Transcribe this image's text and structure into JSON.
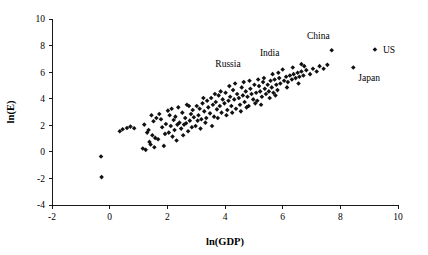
{
  "chart_data": {
    "type": "scatter",
    "title": "",
    "xlabel": "ln(GDP)",
    "ylabel": "ln(E)",
    "xlim": [
      -2,
      10
    ],
    "ylim": [
      -4,
      10
    ],
    "xticks": [
      -2,
      0,
      2,
      4,
      6,
      8,
      10
    ],
    "xticklabels": [
      "-2",
      "0",
      "2",
      "4",
      "6",
      "8",
      "10"
    ],
    "yticks": [
      -4,
      -2,
      0,
      2,
      4,
      6,
      8,
      10
    ],
    "yticklabels": [
      "-4",
      "-2",
      "0",
      "2",
      "4",
      "6",
      "8",
      "10"
    ],
    "grid": false,
    "legend": false,
    "marker": "diamond",
    "marker_color": "#111111",
    "annotations": [
      {
        "label": "Russia",
        "x": 6.0,
        "y": 6.2,
        "label_dx": -42,
        "label_dy": -2
      },
      {
        "label": "India",
        "x": 6.65,
        "y": 6.6,
        "label_dx": -22,
        "label_dy": -8
      },
      {
        "label": "China",
        "x": 7.7,
        "y": 7.65,
        "label_dx": -2,
        "label_dy": -11
      },
      {
        "label": "US",
        "x": 9.2,
        "y": 7.7,
        "label_dx": 8,
        "label_dy": 3
      },
      {
        "label": "Japan",
        "x": 8.45,
        "y": 6.35,
        "label_dx": 5,
        "label_dy": 14
      }
    ],
    "points": [
      [
        -0.3,
        -0.35
      ],
      [
        -0.28,
        -1.9
      ],
      [
        0.35,
        1.55
      ],
      [
        0.45,
        1.7
      ],
      [
        0.6,
        1.8
      ],
      [
        0.72,
        1.9
      ],
      [
        0.85,
        1.78
      ],
      [
        1.2,
        2.05
      ],
      [
        1.3,
        1.45
      ],
      [
        1.38,
        0.75
      ],
      [
        1.42,
        0.55
      ],
      [
        1.48,
        1.25
      ],
      [
        1.52,
        2.3
      ],
      [
        1.55,
        0.35
      ],
      [
        1.58,
        1.05
      ],
      [
        1.62,
        2.55
      ],
      [
        1.68,
        0.95
      ],
      [
        1.72,
        2.85
      ],
      [
        1.78,
        2.45
      ],
      [
        1.82,
        1.85
      ],
      [
        1.88,
        0.45
      ],
      [
        1.92,
        1.35
      ],
      [
        1.95,
        2.1
      ],
      [
        2.02,
        3.1
      ],
      [
        2.08,
        2.75
      ],
      [
        2.12,
        1.95
      ],
      [
        2.18,
        1.15
      ],
      [
        2.22,
        2.4
      ],
      [
        2.28,
        2.65
      ],
      [
        2.32,
        0.85
      ],
      [
        2.38,
        3.35
      ],
      [
        2.42,
        2.2
      ],
      [
        2.48,
        1.75
      ],
      [
        2.52,
        2.95
      ],
      [
        2.58,
        2.05
      ],
      [
        2.62,
        2.55
      ],
      [
        2.68,
        3.55
      ],
      [
        2.72,
        1.55
      ],
      [
        2.78,
        2.35
      ],
      [
        2.82,
        2.85
      ],
      [
        2.88,
        3.15
      ],
      [
        2.92,
        2.6
      ],
      [
        2.98,
        1.95
      ],
      [
        3.02,
        3.45
      ],
      [
        3.08,
        2.75
      ],
      [
        3.12,
        3.25
      ],
      [
        3.18,
        2.45
      ],
      [
        3.22,
        3.65
      ],
      [
        3.28,
        3.05
      ],
      [
        3.32,
        2.2
      ],
      [
        3.38,
        3.85
      ],
      [
        3.42,
        3.35
      ],
      [
        3.48,
        2.9
      ],
      [
        3.52,
        4.05
      ],
      [
        3.58,
        3.55
      ],
      [
        3.62,
        2.65
      ],
      [
        3.68,
        3.75
      ],
      [
        3.72,
        3.2
      ],
      [
        3.78,
        4.25
      ],
      [
        3.82,
        3.45
      ],
      [
        3.88,
        2.95
      ],
      [
        3.92,
        3.95
      ],
      [
        3.98,
        3.65
      ],
      [
        4.02,
        4.45
      ],
      [
        4.08,
        3.15
      ],
      [
        4.12,
        3.85
      ],
      [
        4.18,
        4.15
      ],
      [
        4.22,
        3.45
      ],
      [
        4.28,
        4.65
      ],
      [
        4.32,
        3.95
      ],
      [
        4.38,
        3.25
      ],
      [
        4.42,
        4.35
      ],
      [
        4.48,
        4.05
      ],
      [
        4.52,
        3.55
      ],
      [
        4.58,
        4.85
      ],
      [
        4.62,
        4.25
      ],
      [
        4.68,
        3.75
      ],
      [
        4.72,
        4.55
      ],
      [
        4.78,
        4.15
      ],
      [
        4.82,
        3.45
      ],
      [
        4.88,
        4.75
      ],
      [
        4.92,
        4.35
      ],
      [
        4.98,
        3.95
      ],
      [
        5.02,
        5.05
      ],
      [
        5.08,
        4.45
      ],
      [
        5.12,
        3.85
      ],
      [
        5.18,
        4.95
      ],
      [
        5.22,
        4.55
      ],
      [
        5.28,
        4.15
      ],
      [
        5.32,
        5.25
      ],
      [
        5.38,
        4.75
      ],
      [
        5.42,
        4.35
      ],
      [
        5.48,
        5.05
      ],
      [
        5.52,
        4.55
      ],
      [
        5.58,
        5.35
      ],
      [
        5.62,
        4.85
      ],
      [
        5.68,
        4.45
      ],
      [
        5.72,
        5.45
      ],
      [
        5.78,
        5.05
      ],
      [
        5.82,
        4.65
      ],
      [
        5.88,
        5.55
      ],
      [
        5.92,
        5.15
      ],
      [
        6.05,
        5.35
      ],
      [
        6.12,
        5.65
      ],
      [
        6.18,
        5.25
      ],
      [
        6.25,
        5.75
      ],
      [
        6.32,
        5.45
      ],
      [
        6.38,
        5.85
      ],
      [
        6.45,
        5.55
      ],
      [
        6.52,
        5.95
      ],
      [
        6.58,
        5.65
      ],
      [
        6.65,
        6.05
      ],
      [
        6.72,
        5.75
      ],
      [
        6.82,
        6.15
      ],
      [
        6.95,
        5.85
      ],
      [
        7.05,
        6.25
      ],
      [
        7.18,
        6.05
      ],
      [
        7.28,
        6.45
      ],
      [
        7.42,
        6.25
      ],
      [
        7.55,
        6.55
      ],
      [
        1.15,
        0.25
      ],
      [
        1.25,
        0.15
      ],
      [
        1.35,
        1.65
      ],
      [
        1.45,
        2.75
      ],
      [
        2.05,
        1.45
      ],
      [
        2.15,
        3.25
      ],
      [
        2.25,
        1.65
      ],
      [
        2.35,
        2.05
      ],
      [
        2.55,
        1.25
      ],
      [
        2.65,
        2.15
      ],
      [
        2.75,
        3.45
      ],
      [
        2.85,
        1.85
      ],
      [
        3.05,
        2.35
      ],
      [
        3.15,
        1.75
      ],
      [
        3.25,
        4.05
      ],
      [
        3.35,
        2.55
      ],
      [
        3.55,
        1.95
      ],
      [
        3.65,
        4.35
      ],
      [
        3.75,
        2.55
      ],
      [
        3.85,
        4.55
      ],
      [
        4.05,
        2.75
      ],
      [
        4.15,
        4.95
      ],
      [
        4.25,
        2.95
      ],
      [
        4.35,
        5.15
      ],
      [
        4.55,
        3.05
      ],
      [
        4.65,
        5.25
      ],
      [
        4.75,
        3.35
      ],
      [
        4.85,
        5.35
      ],
      [
        5.05,
        3.65
      ],
      [
        5.15,
        5.45
      ],
      [
        5.25,
        3.55
      ],
      [
        5.35,
        5.55
      ],
      [
        5.55,
        4.05
      ],
      [
        5.65,
        5.85
      ],
      [
        5.75,
        4.25
      ],
      [
        5.85,
        5.95
      ],
      [
        6.15,
        4.85
      ],
      [
        6.35,
        6.35
      ],
      [
        6.55,
        5.15
      ],
      [
        6.75,
        6.45
      ]
    ]
  }
}
